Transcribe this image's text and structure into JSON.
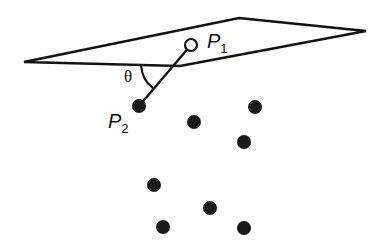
{
  "diagram": {
    "colors": {
      "line": "#111111",
      "point": "#1a1a1a",
      "background": "#ffffff"
    },
    "plane": {
      "vertices": [
        [
          24,
          62
        ],
        [
          239,
          18
        ],
        [
          366,
          31
        ],
        [
          180,
          66
        ]
      ]
    },
    "labels": {
      "p1": "P",
      "p1_sub": "1",
      "p2": "P",
      "p2_sub": "2",
      "angle": "θ"
    },
    "p1": {
      "x": 191,
      "y": 45,
      "type": "open-circle"
    },
    "p2": {
      "x": 139,
      "y": 106,
      "type": "filled-circle"
    },
    "points": [
      {
        "x": 194,
        "y": 122
      },
      {
        "x": 255,
        "y": 107
      },
      {
        "x": 244,
        "y": 142
      },
      {
        "x": 154,
        "y": 185
      },
      {
        "x": 210,
        "y": 208
      },
      {
        "x": 163,
        "y": 227
      },
      {
        "x": 244,
        "y": 228
      }
    ]
  }
}
